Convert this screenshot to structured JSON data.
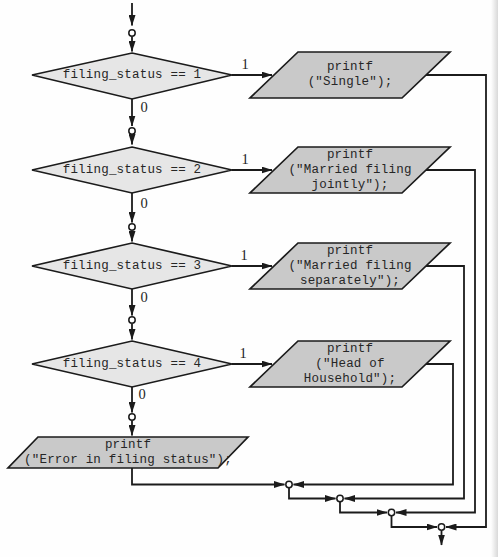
{
  "flowchart": {
    "description": "Nested if/else flowchart for filing status selection",
    "colors": {
      "decision_fill": "#e6e6e6",
      "output_fill": "#c9c9c9",
      "stroke": "#1b1b1b",
      "background": "#fefefe",
      "connector_fill": "#ffffff"
    },
    "decisions": [
      {
        "condition": "filing_status == 1",
        "true_label": "1",
        "false_label": "0"
      },
      {
        "condition": "filing_status == 2",
        "true_label": "1",
        "false_label": "0"
      },
      {
        "condition": "filing_status == 3",
        "true_label": "1",
        "false_label": "0"
      },
      {
        "condition": "filing_status == 4",
        "true_label": "1",
        "false_label": "0"
      }
    ],
    "outputs": [
      {
        "lines": [
          "printf",
          "(\"Single\");"
        ]
      },
      {
        "lines": [
          "printf",
          "(\"Married filing",
          "jointly\");"
        ]
      },
      {
        "lines": [
          "printf",
          "(\"Married filing",
          "separately\");"
        ]
      },
      {
        "lines": [
          "printf",
          "(\"Head of",
          "Household\");"
        ]
      },
      {
        "lines": [
          "printf",
          "(\"Error in filing status\");"
        ]
      }
    ]
  }
}
